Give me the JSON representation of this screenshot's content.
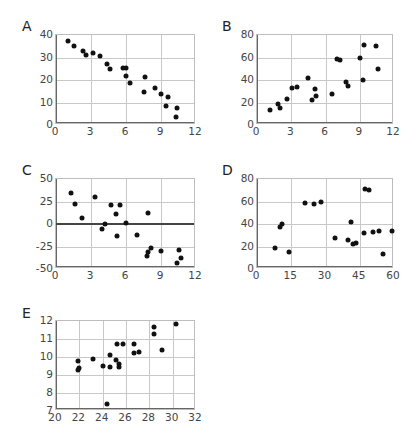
{
  "chart_data": [
    {
      "id": "A",
      "type": "scatter",
      "title": "A",
      "xlabel": "",
      "ylabel": "",
      "xlim": [
        0,
        12
      ],
      "ylim": [
        0,
        40
      ],
      "xticks": [
        0,
        3,
        6,
        9,
        12
      ],
      "yticks": [
        0,
        10,
        20,
        30,
        40
      ],
      "grid": true,
      "points": [
        [
          1.0,
          37.5
        ],
        [
          1.5,
          35
        ],
        [
          2.3,
          33
        ],
        [
          2.6,
          31
        ],
        [
          3.2,
          32.2
        ],
        [
          3.8,
          30.5
        ],
        [
          4.4,
          27
        ],
        [
          4.6,
          25
        ],
        [
          5.7,
          25.3
        ],
        [
          6.0,
          25.3
        ],
        [
          6.0,
          22
        ],
        [
          6.3,
          18.5
        ],
        [
          7.5,
          14.5
        ],
        [
          7.6,
          21.3
        ],
        [
          8.5,
          16.5
        ],
        [
          9.0,
          14
        ],
        [
          9.4,
          8.5
        ],
        [
          9.6,
          12.5
        ],
        [
          10.3,
          3.5
        ],
        [
          10.4,
          7.5
        ]
      ]
    },
    {
      "id": "B",
      "type": "scatter",
      "title": "B",
      "xlabel": "",
      "ylabel": "",
      "xlim": [
        0,
        12
      ],
      "ylim": [
        0,
        80
      ],
      "xticks": [
        0,
        3,
        6,
        9,
        12
      ],
      "yticks": [
        0,
        20,
        40,
        60,
        80
      ],
      "grid": true,
      "points": [
        [
          1.1,
          13
        ],
        [
          1.8,
          19
        ],
        [
          2.0,
          15
        ],
        [
          2.6,
          23
        ],
        [
          3.1,
          33
        ],
        [
          3.5,
          34
        ],
        [
          4.5,
          42
        ],
        [
          4.8,
          22
        ],
        [
          5.1,
          32
        ],
        [
          5.2,
          26
        ],
        [
          6.6,
          28
        ],
        [
          7.0,
          59
        ],
        [
          7.3,
          58
        ],
        [
          7.8,
          38
        ],
        [
          8.0,
          35
        ],
        [
          9.0,
          59.5
        ],
        [
          9.3,
          40
        ],
        [
          9.4,
          71
        ],
        [
          10.4,
          70
        ],
        [
          10.6,
          50
        ]
      ]
    },
    {
      "id": "C",
      "type": "scatter",
      "title": "C",
      "xlabel": "",
      "ylabel": "",
      "xlim": [
        0,
        12
      ],
      "ylim": [
        -50,
        50
      ],
      "xticks": [
        0,
        3,
        6,
        9,
        12
      ],
      "yticks": [
        -50,
        -25,
        0,
        25,
        50
      ],
      "grid": true,
      "zero_line": true,
      "points": [
        [
          1.3,
          34
        ],
        [
          1.6,
          22
        ],
        [
          2.2,
          7
        ],
        [
          3.3,
          30
        ],
        [
          3.9,
          -5
        ],
        [
          4.2,
          0
        ],
        [
          4.7,
          21
        ],
        [
          5.1,
          11
        ],
        [
          5.2,
          -13
        ],
        [
          5.5,
          21
        ],
        [
          6.0,
          1
        ],
        [
          6.9,
          -12
        ],
        [
          7.8,
          -35
        ],
        [
          7.9,
          -31
        ],
        [
          7.9,
          12
        ],
        [
          8.1,
          -27
        ],
        [
          9.0,
          -30
        ],
        [
          10.4,
          -43
        ],
        [
          10.5,
          -29
        ],
        [
          10.7,
          -38
        ]
      ]
    },
    {
      "id": "D",
      "type": "scatter",
      "title": "D",
      "xlabel": "",
      "ylabel": "",
      "xlim": [
        0,
        60
      ],
      "ylim": [
        0,
        80
      ],
      "xticks": [
        0,
        15,
        30,
        45,
        60
      ],
      "yticks": [
        0,
        20,
        40,
        60,
        80
      ],
      "grid": true,
      "points": [
        [
          8,
          19
        ],
        [
          10,
          37.5
        ],
        [
          11,
          40
        ],
        [
          14,
          15
        ],
        [
          21,
          59
        ],
        [
          25,
          57.5
        ],
        [
          28,
          59.5
        ],
        [
          34,
          28
        ],
        [
          40,
          26
        ],
        [
          41,
          42
        ],
        [
          42,
          22
        ],
        [
          43.5,
          23
        ],
        [
          47,
          32
        ],
        [
          47.5,
          71
        ],
        [
          49,
          70
        ],
        [
          51,
          33
        ],
        [
          53.5,
          34
        ],
        [
          55,
          13
        ],
        [
          59,
          34
        ]
      ]
    },
    {
      "id": "E",
      "type": "scatter",
      "title": "E",
      "xlabel": "",
      "ylabel": "",
      "xlim": [
        20,
        32
      ],
      "ylim": [
        7,
        12
      ],
      "xticks": [
        20,
        22,
        24,
        26,
        28,
        30,
        32
      ],
      "yticks": [
        7,
        8,
        9,
        10,
        11,
        12
      ],
      "grid": true,
      "points": [
        [
          21.9,
          9.8
        ],
        [
          21.9,
          9.3
        ],
        [
          22.0,
          9.4
        ],
        [
          23.2,
          9.9
        ],
        [
          24.0,
          9.5
        ],
        [
          24.4,
          7.4
        ],
        [
          24.6,
          10.1
        ],
        [
          24.6,
          9.45
        ],
        [
          25.1,
          9.85
        ],
        [
          25.2,
          10.75
        ],
        [
          25.4,
          9.6
        ],
        [
          25.4,
          9.45
        ],
        [
          25.7,
          10.7
        ],
        [
          26.7,
          10.75
        ],
        [
          26.7,
          10.25
        ],
        [
          27.1,
          10.3
        ],
        [
          28.4,
          11.65
        ],
        [
          28.4,
          11.3
        ],
        [
          29.1,
          10.4
        ],
        [
          30.3,
          11.85
        ]
      ]
    }
  ],
  "panels": {
    "A": {
      "label": "A"
    },
    "B": {
      "label": "B"
    },
    "C": {
      "label": "C"
    },
    "D": {
      "label": "D"
    },
    "E": {
      "label": "E"
    }
  }
}
